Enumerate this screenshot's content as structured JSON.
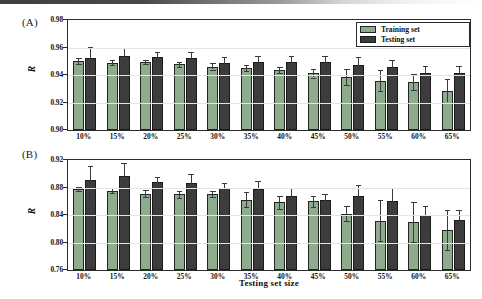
{
  "figure": {
    "panels": [
      {
        "tag": "(A)",
        "ylabel": "R",
        "ylim": [
          0.9,
          0.98
        ],
        "yticks": [
          "0.90",
          "0.92",
          "0.94",
          "0.96",
          "0.98"
        ],
        "ytick_values": [
          0.9,
          0.92,
          0.94,
          0.96,
          0.98
        ]
      },
      {
        "tag": "(B)",
        "ylabel": "R",
        "ylim": [
          0.76,
          0.92
        ],
        "yticks": [
          "0.76",
          "0.80",
          "0.84",
          "0.88",
          "0.92"
        ],
        "ytick_values": [
          0.76,
          0.8,
          0.84,
          0.88,
          0.92
        ]
      }
    ],
    "xlabel": "Testing set size",
    "legend": {
      "position": "top-right-panel-A",
      "entries": [
        {
          "label": "Training set",
          "color": "#8fab8d"
        },
        {
          "label": "Testing set",
          "color": "#3c3c3c"
        }
      ]
    }
  },
  "chart_data": [
    {
      "type": "bar",
      "panel": "(A)",
      "title": "",
      "xlabel": "Testing set size",
      "ylabel": "R",
      "ylim": [
        0.9,
        0.98
      ],
      "yticks": [
        0.9,
        0.92,
        0.94,
        0.96,
        0.98
      ],
      "grid": true,
      "legend": [
        "Training set",
        "Testing set"
      ],
      "categories": [
        "10%",
        "15%",
        "20%",
        "25%",
        "30%",
        "35%",
        "40%",
        "45%",
        "50%",
        "55%",
        "60%",
        "65%"
      ],
      "series": [
        {
          "name": "Training set",
          "color": "#8fab8d",
          "values": [
            0.95,
            0.949,
            0.9495,
            0.9478,
            0.9462,
            0.945,
            0.9435,
            0.9412,
            0.9385,
            0.936,
            0.9348,
            0.9285
          ],
          "errors": [
            0.0022,
            0.0018,
            0.0012,
            0.002,
            0.0022,
            0.002,
            0.002,
            0.003,
            0.006,
            0.0075,
            0.0058,
            0.0085
          ]
        },
        {
          "name": "Testing set",
          "color": "#3c3c3c",
          "values": [
            0.9522,
            0.9538,
            0.9532,
            0.9525,
            0.949,
            0.9492,
            0.9492,
            0.9495,
            0.9472,
            0.9458,
            0.9418,
            0.9418
          ]
        }
      ],
      "series_errors": [
        {
          "name": "Testing set",
          "errors": [
            0.008,
            0.0062,
            0.0038,
            0.0045,
            0.0042,
            0.0048,
            0.0048,
            0.0042,
            0.0058,
            0.0055,
            0.0045,
            0.0048
          ]
        }
      ]
    },
    {
      "type": "bar",
      "panel": "(B)",
      "title": "",
      "xlabel": "Testing set size",
      "ylabel": "R",
      "ylim": [
        0.76,
        0.92
      ],
      "yticks": [
        0.76,
        0.8,
        0.84,
        0.88,
        0.92
      ],
      "grid": true,
      "legend": [
        "Training set",
        "Testing set"
      ],
      "categories": [
        "10%",
        "15%",
        "20%",
        "25%",
        "30%",
        "35%",
        "40%",
        "45%",
        "50%",
        "55%",
        "60%",
        "65%"
      ],
      "series": [
        {
          "name": "Training set",
          "color": "#8fab8d",
          "values": [
            0.8785,
            0.8755,
            0.8712,
            0.87,
            0.8705,
            0.862,
            0.8585,
            0.86,
            0.842,
            0.832,
            0.83,
            0.8185
          ],
          "errors": [
            0.003,
            0.004,
            0.0055,
            0.005,
            0.004,
            0.011,
            0.0095,
            0.008,
            0.011,
            0.03,
            0.029,
            0.029
          ]
        },
        {
          "name": "Testing set",
          "color": "#3c3c3c",
          "values": [
            0.891,
            0.8975,
            0.888,
            0.8862,
            0.88,
            0.878,
            0.868,
            0.862,
            0.867,
            0.86,
            0.8405,
            0.833
          ]
        }
      ],
      "series_errors": [
        {
          "name": "Testing set",
          "errors": [
            0.02,
            0.018,
            0.0075,
            0.014,
            0.007,
            0.011,
            0.012,
            0.0085,
            0.016,
            0.019,
            0.013,
            0.015
          ]
        }
      ]
    }
  ]
}
